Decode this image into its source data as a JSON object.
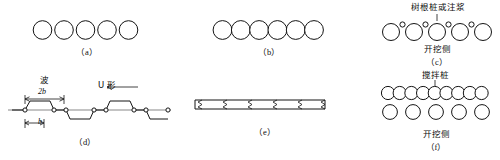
{
  "figure": {
    "title": "",
    "background_color": "#ffffff",
    "line_color": "#141414",
    "panel_count": 6
  },
  "panels": {
    "a": {
      "caption": "（a）",
      "type": "separated-circles-single-row",
      "circle_count": 5,
      "circle_diameter": 19,
      "spacing": 21.5,
      "overlap": false
    },
    "b": {
      "caption": "（b）",
      "type": "tangent-circles-single-row",
      "circle_count": 6,
      "circle_diameter": 19,
      "spacing": 18.5,
      "overlap": false
    },
    "c": {
      "caption": "（c）",
      "type": "circles-with-small-grout-piles",
      "circle_count": 5,
      "circle_diameter": 17,
      "spacing": 18,
      "small_circle_count": 4,
      "small_circle_diameter": 4.5,
      "top_label": "树根桩或注浆",
      "bottom_label": "开挖侧"
    },
    "d": {
      "caption": "（d）",
      "type": "u-section-sheet-pile-plan",
      "wave_label": "波",
      "dimension_full": "2b",
      "dimension_half": "b",
      "shape_label": "U 形",
      "wave_count": 3,
      "node_marker_count": 7
    },
    "e": {
      "caption": "（e）",
      "type": "flat-sheet-pile-plan",
      "joint_count": 5,
      "bar_length": 128,
      "bar_thickness": 9
    },
    "f": {
      "caption": "（f）",
      "type": "overlapping-mixing-piles-two-rows",
      "top_row_circle_count": 9,
      "top_row_circle_diameter": 13,
      "top_row_overlap": true,
      "bottom_row_circle_count": 5,
      "bottom_row_circle_diameter": 15,
      "bottom_row_overlap": false,
      "top_label": "搅拌桩",
      "bottom_label": "开挖侧"
    }
  }
}
